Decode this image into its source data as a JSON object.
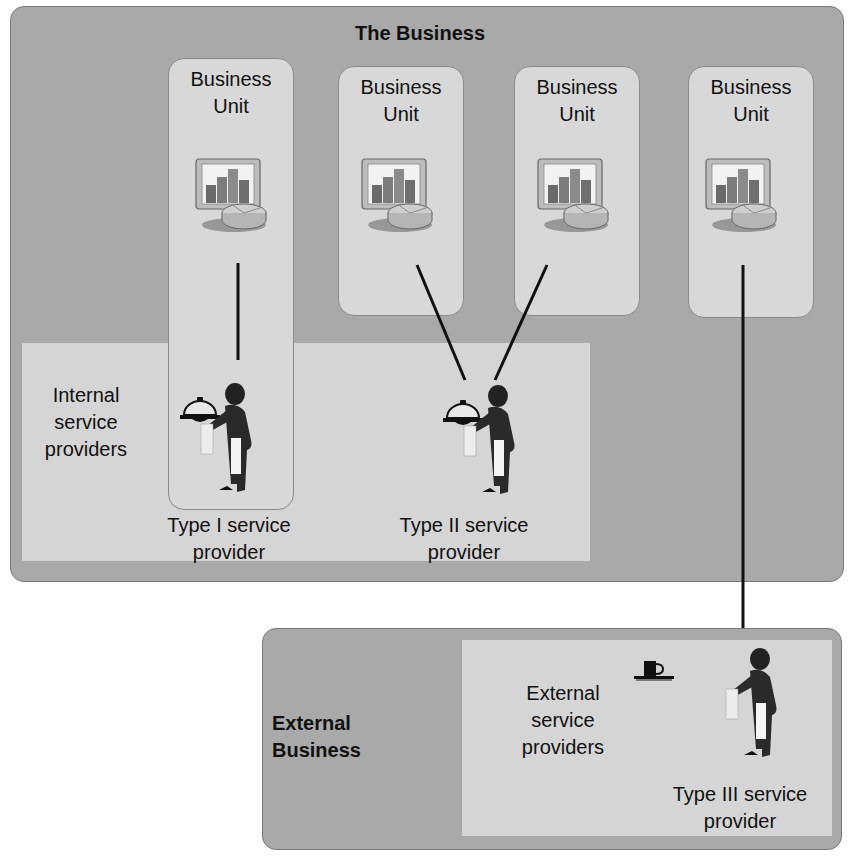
{
  "business": {
    "title": "The Business",
    "units": [
      {
        "label_line1": "Business",
        "label_line2": "Unit",
        "icon": "business-chart-icon"
      },
      {
        "label_line1": "Business",
        "label_line2": "Unit",
        "icon": "business-chart-icon"
      },
      {
        "label_line1": "Business",
        "label_line2": "Unit",
        "icon": "business-chart-icon"
      },
      {
        "label_line1": "Business",
        "label_line2": "Unit",
        "icon": "business-chart-icon"
      }
    ],
    "internal_zone": {
      "label_line1": "Internal",
      "label_line2": "service",
      "label_line3": "providers"
    },
    "providers": [
      {
        "label_line1": "Type I service",
        "label_line2": "provider",
        "icon": "waiter-cloche-icon"
      },
      {
        "label_line1": "Type II service",
        "label_line2": "provider",
        "icon": "waiter-cloche-icon"
      }
    ]
  },
  "external": {
    "title_line1": "External",
    "title_line2": "Business",
    "zone": {
      "label_line1": "External",
      "label_line2": "service",
      "label_line3": "providers"
    },
    "provider": {
      "label_line1": "Type III service",
      "label_line2": "provider",
      "icon": "waiter-cup-icon"
    }
  },
  "colors": {
    "outer_box": "#a9a9a9",
    "inner_zone": "#d5d5d5",
    "unit_box": "#d8d8d8",
    "ink": "#111111"
  }
}
